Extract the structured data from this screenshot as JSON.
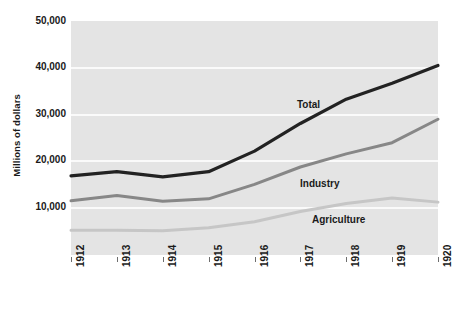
{
  "chart_data": {
    "type": "line",
    "title": "",
    "xlabel": "",
    "ylabel": "Millions of dollars",
    "categories": [
      "1912",
      "1913",
      "1914",
      "1915",
      "1916",
      "1917",
      "1918",
      "1919",
      "1920"
    ],
    "x": [
      1912,
      1913,
      1914,
      1915,
      1916,
      1917,
      1918,
      1919,
      1920
    ],
    "ylim": [
      0,
      50000
    ],
    "xlim": [
      1912,
      1920
    ],
    "grid": true,
    "legend_position": "inline-annotations",
    "y_ticks": [
      10000,
      20000,
      30000,
      40000,
      50000
    ],
    "y_tick_labels": [
      "10,000",
      "20,000",
      "30,000",
      "40,000",
      "50,000"
    ],
    "series": [
      {
        "name": "Total",
        "color": "#222222",
        "values": [
          16900,
          17800,
          16700,
          17800,
          22200,
          28100,
          33300,
          36700,
          40500
        ]
      },
      {
        "name": "Industry",
        "color": "#878787",
        "values": [
          11600,
          12700,
          11500,
          12000,
          15100,
          18800,
          21600,
          24000,
          29000
        ]
      },
      {
        "name": "Agriculture",
        "color": "#c6c6c6",
        "values": [
          5300,
          5300,
          5200,
          5800,
          7100,
          9300,
          11000,
          12200,
          11300
        ]
      }
    ]
  },
  "axis": {
    "y_title": "Millions of dollars"
  },
  "annotations": {
    "total": "Total",
    "industry": "Industry",
    "agriculture": "Agriculture"
  },
  "colors": {
    "plot_background": "#e4e4e4",
    "gridline": "#fafafa",
    "page_background": "#ffffff",
    "text": "#1a1a1a",
    "total_line": "#222222",
    "industry_line": "#878787",
    "agriculture_line": "#c6c6c6"
  }
}
